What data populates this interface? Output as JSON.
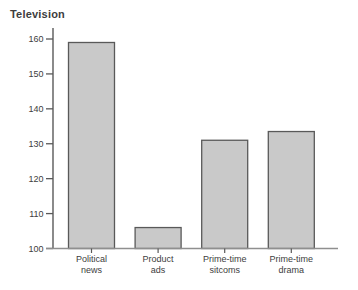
{
  "title": "Television",
  "chart_data": {
    "type": "bar",
    "title": "Television",
    "categories": [
      "Political news",
      "Product ads",
      "Prime-time sitcoms",
      "Prime-time drama"
    ],
    "category_lines": [
      [
        "Political",
        "news"
      ],
      [
        "Product",
        "ads"
      ],
      [
        "Prime-time",
        "sitcoms"
      ],
      [
        "Prime-time",
        "drama"
      ]
    ],
    "values": [
      159,
      106,
      131,
      133.5
    ],
    "xlabel": "",
    "ylabel": "",
    "ylim": [
      100,
      160
    ],
    "yticks": [
      100,
      110,
      120,
      130,
      140,
      150,
      160
    ],
    "grid": false,
    "legend": null,
    "colors": {
      "bar_fill": "#c9c9c9",
      "bar_border": "#595959",
      "axis": "#595959",
      "x_axis": "#8f8f8f",
      "text": "#3d3d3d"
    }
  }
}
